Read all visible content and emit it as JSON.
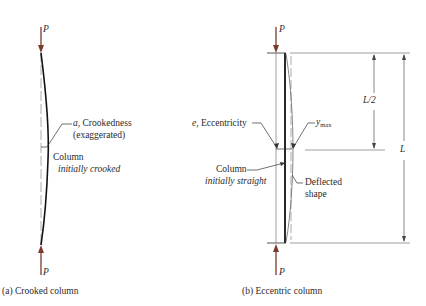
{
  "colors": {
    "load_arrow": "#7a3b2e",
    "column_line": "#111111",
    "guide_line": "#888888",
    "dimension_line": "#555555",
    "text": "#2a2a2a"
  },
  "diagram_a": {
    "caption": "(a) Crooked column",
    "load_top_label": "P",
    "load_bottom_label": "P",
    "crookedness_symbol": "a",
    "crookedness_label": ", Crookedness",
    "crookedness_note": "(exaggerated)",
    "column_label": "Column",
    "column_note": "initially crooked"
  },
  "diagram_b": {
    "caption": "(b) Eccentric column",
    "load_top_label": "P",
    "load_bottom_label": "P",
    "eccentricity_symbol": "e",
    "eccentricity_label": ", Eccentricity",
    "ymax_symbol": "y",
    "ymax_subscript": "max",
    "column_label": "Column",
    "column_note": "initially straight",
    "deflected_label": "Deflected",
    "deflected_label_2": "shape",
    "half_length_label": "L/2",
    "length_label": "L"
  }
}
